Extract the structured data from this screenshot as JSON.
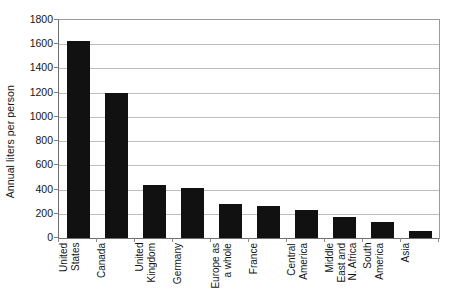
{
  "chart_data": {
    "type": "bar",
    "title": "",
    "xlabel": "",
    "ylabel": "Annual liters per person",
    "ylim": [
      0,
      1800
    ],
    "ytick_step": 200,
    "yticks": [
      0,
      200,
      400,
      600,
      800,
      1000,
      1200,
      1400,
      1600,
      1800
    ],
    "ytick_labels": [
      "0",
      "200",
      "400",
      "600",
      "800",
      "1000",
      "1200",
      "1400",
      "1600",
      "1800"
    ],
    "grid": "horizontal",
    "legend": "none",
    "bar_color": "#111111",
    "gridline_color": "#bdbdbd",
    "axis_color": "#6e6e6e",
    "background_color": "#ffffff",
    "categories": [
      "United States",
      "Canada",
      "United Kingdom",
      "Germany",
      "Europe as a whole",
      "France",
      "Central America",
      "Middle East and N. Africa",
      "South America",
      "Asia"
    ],
    "category_label_lines": [
      [
        "United",
        "States"
      ],
      [
        "Canada"
      ],
      [
        "United",
        "Kingdom"
      ],
      [
        "Germany"
      ],
      [
        "Europe as",
        "a whole"
      ],
      [
        "France"
      ],
      [
        "Central",
        "America"
      ],
      [
        "Middle",
        "East and",
        "N. Africa"
      ],
      [
        "South",
        "America"
      ],
      [
        "Asia"
      ]
    ],
    "values": [
      1630,
      1200,
      440,
      410,
      280,
      265,
      230,
      175,
      130,
      60
    ]
  }
}
